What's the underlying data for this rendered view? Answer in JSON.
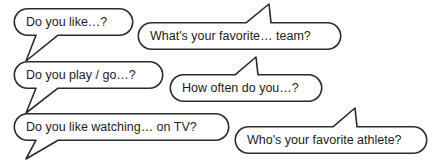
{
  "diagram": {
    "type": "speech-bubble-diagram",
    "canvas": {
      "width": 434,
      "height": 163
    },
    "colors": {
      "background": "#ffffff",
      "outline": "#2b2b2b",
      "text": "#1c1c1c",
      "fill": "#ffffff"
    },
    "bubbles": [
      {
        "id": "bubble-do-you-like",
        "text": "Do you like…?",
        "tail": "down-left",
        "row": 1,
        "column": "left",
        "box": {
          "x": 14,
          "y": 8,
          "width": 119,
          "height": 27
        },
        "text_anchor": {
          "x": 26,
          "y": 22
        },
        "tail_points": "36,35 26,61 58,35"
      },
      {
        "id": "bubble-favorite-team",
        "text": "What's your favorite… team?",
        "tail": "up-right",
        "row": 1,
        "column": "right",
        "box": {
          "x": 138,
          "y": 22,
          "width": 203,
          "height": 27
        },
        "text_anchor": {
          "x": 150,
          "y": 36
        },
        "tail_points": "246,22 269,4 271,22"
      },
      {
        "id": "bubble-play-go",
        "text": "Do you play / go…?",
        "tail": "down-left",
        "row": 2,
        "column": "left",
        "box": {
          "x": 14,
          "y": 61,
          "width": 149,
          "height": 27
        },
        "text_anchor": {
          "x": 26,
          "y": 75
        },
        "tail_points": "36,88 26,113 58,88"
      },
      {
        "id": "bubble-how-often",
        "text": "How often do you…?",
        "tail": "up-right",
        "row": 2,
        "column": "right",
        "box": {
          "x": 170,
          "y": 74,
          "width": 152,
          "height": 27
        },
        "text_anchor": {
          "x": 182,
          "y": 88
        },
        "tail_points": "235,74 256,57 258,74"
      },
      {
        "id": "bubble-watching-tv",
        "text": "Do you like watching… on TV?",
        "tail": "down-left",
        "row": 3,
        "column": "left",
        "box": {
          "x": 14,
          "y": 113,
          "width": 215,
          "height": 27
        },
        "text_anchor": {
          "x": 26,
          "y": 127
        },
        "tail_points": "36,140 26,159 58,140"
      },
      {
        "id": "bubble-favorite-athlete",
        "text": "Who's your favorite athlete?",
        "tail": "up-right",
        "row": 3,
        "column": "right",
        "box": {
          "x": 235,
          "y": 126,
          "width": 192,
          "height": 27
        },
        "text_anchor": {
          "x": 247,
          "y": 140
        },
        "tail_points": "333,126 355,108 357,126"
      }
    ]
  }
}
